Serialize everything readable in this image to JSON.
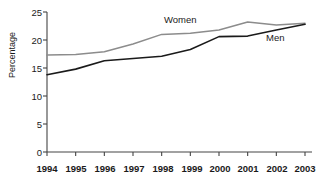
{
  "chart_data": {
    "type": "line",
    "title": "",
    "xlabel": "",
    "ylabel": "Percentage",
    "x": [
      1994,
      1995,
      1996,
      1997,
      1998,
      1999,
      2000,
      2001,
      2002,
      2003
    ],
    "categories": [
      "1994",
      "1995",
      "1996",
      "1997",
      "1998",
      "1999",
      "2000",
      "2001",
      "2002",
      "2003"
    ],
    "series": [
      {
        "name": "Women",
        "color": "#8c8c8c",
        "values": [
          17.3,
          17.4,
          17.9,
          19.3,
          21.0,
          21.2,
          21.8,
          23.2,
          22.7,
          23.0
        ]
      },
      {
        "name": "Men",
        "color": "#1a1a1a",
        "values": [
          13.8,
          14.8,
          16.3,
          16.7,
          17.1,
          18.3,
          20.6,
          20.7,
          21.8,
          22.8
        ]
      }
    ],
    "ylim": [
      0,
      25
    ],
    "yticks": [
      0,
      5,
      10,
      15,
      20,
      25
    ],
    "ytick_labels": [
      "0",
      "5",
      "10",
      "15",
      "20",
      "25"
    ],
    "xlim": [
      1994,
      2003
    ],
    "grid": false,
    "legend": "inline-annotations",
    "annotations": [
      {
        "text": "Women",
        "x": 1998,
        "y": 23.9
      },
      {
        "text": "Men",
        "x": 2001.7,
        "y": 20.1
      }
    ]
  }
}
